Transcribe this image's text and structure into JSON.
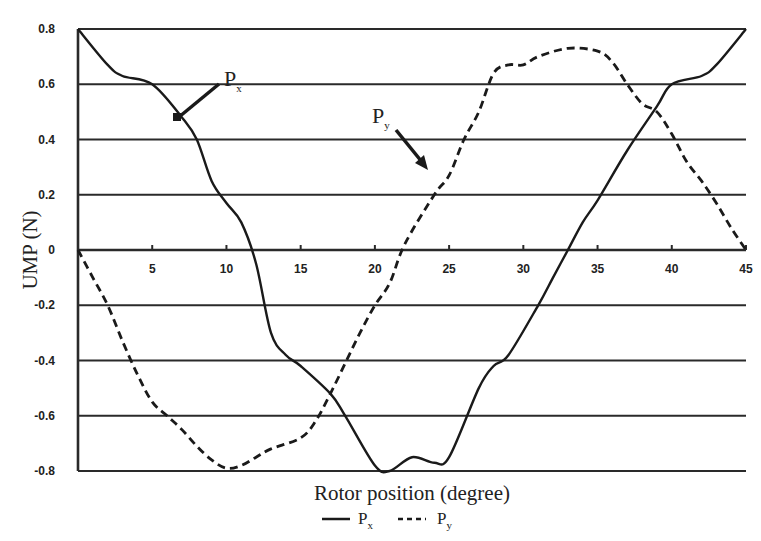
{
  "chart_data": {
    "type": "line",
    "title": "",
    "xlabel": "Rotor position (degree)",
    "ylabel": "UMP (N)",
    "xlim": [
      0,
      45
    ],
    "ylim": [
      -0.8,
      0.8
    ],
    "x_ticks": [
      5,
      10,
      15,
      20,
      25,
      30,
      35,
      40,
      45
    ],
    "x_tick_labels": [
      "5",
      "10",
      "15",
      "20",
      "25",
      "30",
      "35",
      "40",
      "45"
    ],
    "y_ticks": [
      0.8,
      0.6,
      0.4,
      0.2,
      0,
      -0.2,
      -0.4,
      -0.6,
      -0.8
    ],
    "y_tick_labels": [
      "0.8",
      "0.6",
      "0.4",
      "0.2",
      "0",
      "-0.2",
      "-0.4",
      "-0.6",
      "-0.8"
    ],
    "grid": "horizontal",
    "legend_position": "bottom-center",
    "series": [
      {
        "name": "Px",
        "style": "solid",
        "x": [
          0,
          2,
          3,
          5,
          7,
          8,
          9,
          10,
          11,
          12,
          13,
          14,
          15,
          17,
          18,
          20,
          21,
          22.5,
          24,
          25,
          27,
          28,
          29,
          31,
          32,
          33,
          34,
          35,
          37,
          39,
          40,
          42,
          43,
          45
        ],
        "y": [
          0.8,
          0.67,
          0.63,
          0.6,
          0.48,
          0.4,
          0.25,
          0.17,
          0.1,
          -0.05,
          -0.3,
          -0.38,
          -0.42,
          -0.52,
          -0.6,
          -0.78,
          -0.8,
          -0.75,
          -0.77,
          -0.75,
          -0.5,
          -0.42,
          -0.38,
          -0.2,
          -0.1,
          0,
          0.1,
          0.18,
          0.36,
          0.52,
          0.6,
          0.63,
          0.67,
          0.8
        ]
      },
      {
        "name": "Py",
        "style": "dashed",
        "x": [
          0,
          1,
          2,
          3,
          4,
          5,
          6,
          7,
          8,
          9,
          10,
          11,
          12,
          13,
          15,
          16,
          17,
          18,
          19,
          20,
          21,
          22,
          24,
          25,
          26,
          27,
          28,
          29,
          30,
          31,
          33,
          35,
          36,
          37,
          38,
          39,
          40,
          41,
          42,
          43,
          44,
          45
        ],
        "y": [
          0,
          -0.1,
          -0.2,
          -0.33,
          -0.45,
          -0.55,
          -0.6,
          -0.65,
          -0.71,
          -0.76,
          -0.79,
          -0.78,
          -0.75,
          -0.72,
          -0.68,
          -0.62,
          -0.52,
          -0.41,
          -0.3,
          -0.2,
          -0.12,
          0.02,
          0.2,
          0.27,
          0.4,
          0.5,
          0.64,
          0.67,
          0.67,
          0.7,
          0.73,
          0.72,
          0.68,
          0.6,
          0.53,
          0.5,
          0.42,
          0.32,
          0.25,
          0.17,
          0.08,
          0
        ]
      }
    ],
    "annotations": [
      {
        "text": "P",
        "subscript": "x",
        "arrow_to": [
          7,
          0.48
        ]
      },
      {
        "text": "P",
        "subscript": "y",
        "arrow_to": [
          23.5,
          0.29
        ]
      }
    ]
  },
  "legend": {
    "items": [
      {
        "label": "P",
        "sub": "x",
        "style": "solid"
      },
      {
        "label": "P",
        "sub": "y",
        "style": "dashed"
      }
    ]
  },
  "labels": {
    "xlabel": "Rotor position (degree)",
    "ylabel": "UMP (N)",
    "px_main": "P",
    "px_sub": "x",
    "py_main": "P",
    "py_sub": "y"
  },
  "colors": {
    "line": "#1a1a1a",
    "grid": "#2a2a2a",
    "background": "#ffffff"
  }
}
